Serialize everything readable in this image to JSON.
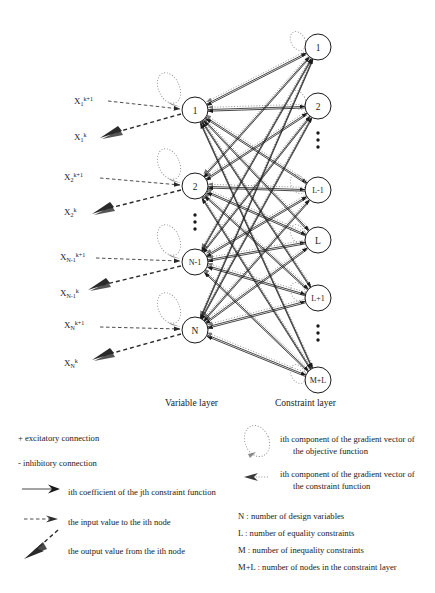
{
  "diagram": {
    "layers": {
      "variable_layer_label": "Variable layer",
      "constraint_layer_label": "Constraint layer"
    },
    "variable_nodes": [
      {
        "label": "1",
        "id": "v1"
      },
      {
        "label": "2",
        "id": "v2"
      },
      {
        "label": "⋮",
        "id": "v-dots"
      },
      {
        "label": "N-1",
        "id": "vN-1"
      },
      {
        "label": "N",
        "id": "vN"
      }
    ],
    "constraint_nodes": [
      {
        "label": "1",
        "id": "c1"
      },
      {
        "label": "2",
        "id": "c2"
      },
      {
        "label": "⋮",
        "id": "c-dots-1"
      },
      {
        "label": "L-1",
        "id": "cL-1"
      },
      {
        "label": "L",
        "id": "cL"
      },
      {
        "label": "L+1",
        "id": "cL+1"
      },
      {
        "label": "⋮",
        "id": "c-dots-2"
      },
      {
        "label": "M+L",
        "id": "cM+L"
      }
    ],
    "io_labels": [
      {
        "base": "X",
        "sub": "1",
        "sup": "k+1",
        "kind": "input",
        "id": "x1-in"
      },
      {
        "base": "X",
        "sub": "1",
        "sup": "k",
        "kind": "output",
        "id": "x1-out"
      },
      {
        "base": "X",
        "sub": "2",
        "sup": "k+1",
        "kind": "input",
        "id": "x2-in"
      },
      {
        "base": "X",
        "sub": "2",
        "sup": "k",
        "kind": "output",
        "id": "x2-out"
      },
      {
        "base": "X",
        "sub": "N-1",
        "sup": "k+1",
        "kind": "input",
        "id": "xN-1-in"
      },
      {
        "base": "X",
        "sub": "N-1",
        "sup": "k",
        "kind": "output",
        "id": "xN-1-out"
      },
      {
        "base": "X",
        "sub": "N",
        "sup": "k+1",
        "kind": "input",
        "id": "xN-in"
      },
      {
        "base": "X",
        "sub": "N",
        "sup": "k",
        "kind": "output",
        "id": "xN-out"
      }
    ]
  },
  "legend": {
    "left": [
      {
        "id": "excitatory",
        "symbol": "plus-sign",
        "text": "+ excitatory connection"
      },
      {
        "id": "inhibitory",
        "symbol": "minus-sign",
        "text": "- inhibitory connection"
      },
      {
        "id": "coefficient",
        "symbol": "solid-arrow-icon",
        "text": "ith coefficient of the jth constraint function"
      },
      {
        "id": "input-value",
        "symbol": "dashed-arrow-icon",
        "text": "the input value to the ith node"
      },
      {
        "id": "output-value",
        "symbol": "thick-dashed-arrow-icon",
        "text": "the output value from the ith node"
      }
    ],
    "right": [
      {
        "id": "objective-gradient",
        "symbol": "dotted-loop-icon",
        "line1": "ith component of the gradient vector of",
        "line2": "the objective function"
      },
      {
        "id": "constraint-gradient",
        "symbol": "dotted-arrow-icon",
        "line1": "ith component of the gradient vector of",
        "line2": "the constraint function"
      }
    ],
    "definitions": [
      {
        "id": "def-N",
        "text": "N : number of design variables"
      },
      {
        "id": "def-L",
        "text": "L : number of equality constraints"
      },
      {
        "id": "def-M",
        "text": "M : number of inequality constraints"
      },
      {
        "id": "def-ML",
        "text": "M+L : number of nodes in the constraint layer"
      }
    ]
  },
  "colors": {
    "ink": "#1a1a1a",
    "dotted": "#767676",
    "paper": "#ffffff"
  }
}
